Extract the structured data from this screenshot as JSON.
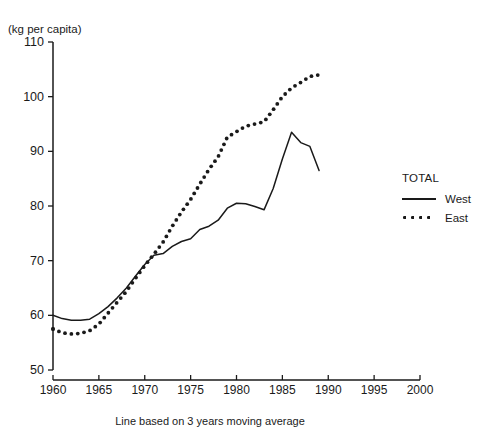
{
  "chart_data": {
    "type": "line",
    "title": "",
    "unit_label": "(kg per capita)",
    "caption": "Line based on 3 years moving average",
    "xlabel": "",
    "ylabel": "",
    "xlim": [
      1960,
      2000
    ],
    "ylim": [
      50,
      110
    ],
    "xticks": [
      1960,
      1965,
      1970,
      1975,
      1980,
      1985,
      1990,
      1995,
      2000
    ],
    "yticks": [
      50,
      60,
      70,
      80,
      90,
      100,
      110
    ],
    "grid": false,
    "legend_position": "right",
    "legend_title": "TOTAL",
    "series": [
      {
        "name": "West",
        "style": "solid",
        "color": "#1a1a1a",
        "x": [
          1960,
          1961,
          1962,
          1963,
          1964,
          1965,
          1966,
          1967,
          1968,
          1969,
          1970,
          1971,
          1972,
          1973,
          1974,
          1975,
          1976,
          1977,
          1978,
          1979,
          1980,
          1981,
          1982,
          1983,
          1984,
          1985,
          1986,
          1987,
          1988,
          1989
        ],
        "values": [
          60.0,
          59.4,
          59.1,
          59.1,
          59.3,
          60.3,
          61.6,
          63.2,
          65.0,
          67.2,
          69.3,
          71.0,
          71.3,
          72.6,
          73.5,
          74.0,
          75.7,
          76.3,
          77.4,
          79.6,
          80.5,
          80.4,
          79.9,
          79.3,
          83.2,
          88.6,
          93.5,
          91.6,
          90.9,
          86.5
        ]
      },
      {
        "name": "East",
        "style": "dotted",
        "color": "#1a1a1a",
        "x": [
          1960,
          1961,
          1962,
          1963,
          1964,
          1965,
          1966,
          1967,
          1968,
          1969,
          1970,
          1971,
          1972,
          1973,
          1974,
          1975,
          1976,
          1977,
          1978,
          1979,
          1980,
          1981,
          1982,
          1983,
          1984,
          1985,
          1986,
          1987,
          1988,
          1989
        ],
        "values": [
          57.5,
          56.8,
          56.6,
          56.7,
          57.2,
          58.4,
          60.4,
          62.4,
          64.4,
          66.8,
          69.1,
          71.2,
          73.4,
          76.3,
          78.9,
          81.2,
          84.0,
          86.7,
          89.0,
          92.6,
          93.6,
          94.6,
          95.0,
          95.4,
          97.6,
          100.0,
          101.6,
          102.6,
          103.7,
          104.0
        ]
      }
    ]
  },
  "legend": {
    "title": "TOTAL",
    "entries": [
      {
        "label": "West",
        "style": "solid"
      },
      {
        "label": "East",
        "style": "dotted"
      }
    ]
  }
}
